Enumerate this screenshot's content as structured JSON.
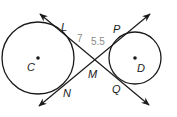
{
  "figure": {
    "colors": {
      "stroke": "#1a1a1a",
      "measure": "#8a8a8a",
      "background": "#ffffff"
    },
    "circles": [
      {
        "name": "C",
        "cx": 38,
        "cy": 58,
        "r": 36
      },
      {
        "name": "D",
        "cx": 135,
        "cy": 58,
        "r": 26
      }
    ],
    "points": {
      "L": "L",
      "P": "P",
      "C": "C",
      "D": "D",
      "M": "M",
      "N": "N",
      "Q": "Q"
    },
    "measures": {
      "LM": "7",
      "MP": "5.5"
    }
  }
}
